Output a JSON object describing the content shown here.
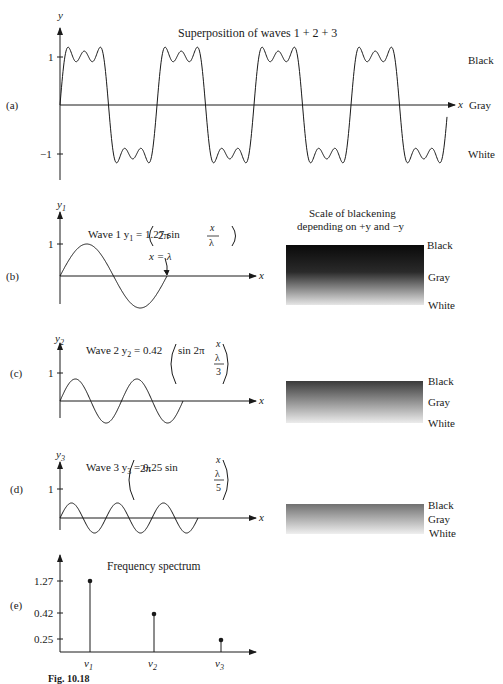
{
  "panels": {
    "a": {
      "label": "(a)",
      "title": "Superposition of waves 1 + 2 + 3",
      "y_axis": "y",
      "x_axis": "x",
      "tick_pos": "1",
      "tick_neg": "−1",
      "right_labels": [
        "Black",
        "Gray",
        "White"
      ]
    },
    "b": {
      "label": "(b)",
      "y_axis": "y",
      "y_sub": "1",
      "x_axis": "x",
      "tick": "1",
      "equation_prefix": "Wave 1  y",
      "equation_sub": "1",
      "equation_mid": " = 1.27 sin",
      "equation_arg": "2π",
      "frac_num": "x",
      "frac_den": "λ",
      "annotation": "x = λ",
      "scale_title_1": "Scale of blackening",
      "scale_title_2": "depending on +y and −y",
      "right_labels": [
        "Black",
        "Gray",
        "White"
      ]
    },
    "c": {
      "label": "(c)",
      "y_axis": "y",
      "y_sub": "2",
      "x_axis": "x",
      "tick": "1",
      "equation_prefix": "Wave 2  y",
      "equation_sub": "2",
      "equation_mid": " = 0.42",
      "equation_arg": "sin 2π",
      "frac_num": "x",
      "frac_mid": "λ",
      "frac_den": "3",
      "right_labels": [
        "Black",
        "Gray",
        "White"
      ]
    },
    "d": {
      "label": "(d)",
      "y_axis": "y",
      "y_sub": "3",
      "x_axis": "x",
      "tick": "1",
      "equation_prefix": "Wave 3  y",
      "equation_sub": "3",
      "equation_mid": " = 0.25 sin",
      "equation_arg": "2π",
      "frac_num": "x",
      "frac_mid": "λ",
      "frac_den": "5",
      "right_labels": [
        "Black",
        "Gray",
        "White"
      ]
    },
    "e": {
      "label": "(e)",
      "title": "Frequency spectrum",
      "ticks": [
        "1.27",
        "0.42",
        "0.25"
      ],
      "x_labels": [
        "ν",
        "ν",
        "ν"
      ],
      "x_subs": [
        "1",
        "2",
        "3"
      ]
    }
  },
  "caption": "Fig. 10.18",
  "chart_data": [
    {
      "type": "line",
      "title": "Superposition of waves 1 + 2 + 3",
      "xlabel": "x",
      "ylabel": "y",
      "yticks": [
        -1,
        1
      ],
      "description": "Square-like wave, sum of 3 odd harmonics, 4 cycles",
      "right_labels": [
        "Black",
        "Gray",
        "White"
      ]
    },
    {
      "type": "line",
      "title": "Wave 1  y1 = 1.27 sin(2π x/λ)",
      "amplitude": 1.27,
      "cycles": 1,
      "annotation": "x = λ"
    },
    {
      "type": "line",
      "title": "Wave 2  y2 = 0.42 sin(2π x/(λ/3))",
      "amplitude": 0.42,
      "cycles": 3
    },
    {
      "type": "line",
      "title": "Wave 3  y3 = 0.25 sin(2π x/(λ/5))",
      "amplitude": 0.25,
      "cycles": 5
    },
    {
      "type": "bar",
      "title": "Frequency spectrum",
      "categories": [
        "ν1",
        "ν2",
        "ν3"
      ],
      "values": [
        1.27,
        0.42,
        0.25
      ],
      "yticks": [
        0.25,
        0.42,
        1.27
      ]
    }
  ]
}
